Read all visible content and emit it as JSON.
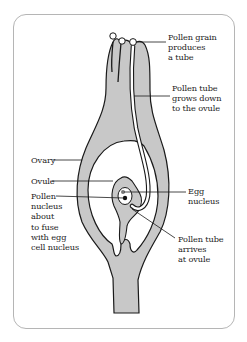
{
  "diagram": {
    "colors": {
      "tissue_fill": "#c8c8c8",
      "outline": "#1a1a1a",
      "cavity": "#ffffff",
      "border": "#b5b5b5"
    },
    "labels": {
      "pollen_grain": "Pollen grain\nproduces\na tube",
      "pollen_tube_grows": "Pollen tube\ngrows down\nto the ovule",
      "ovary": "Ovary",
      "ovule": "Ovule",
      "pollen_nucleus": "Pollen\nnucleus\nabout\nto fuse\nwith egg\ncell nucleus",
      "egg_nucleus": "Egg\nnucleus",
      "pollen_tube_arrives": "Pollen tube\narrives\nat ovule"
    }
  }
}
